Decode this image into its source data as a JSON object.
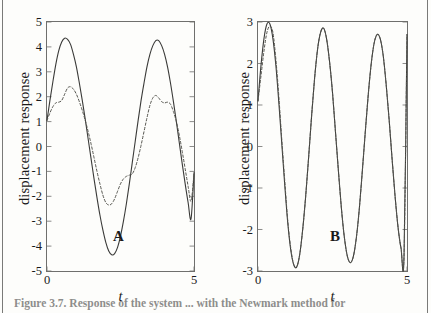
{
  "figure": {
    "caption_fragment": "Figure 3.7.   Response of the system ... with the Newmark method for",
    "panels": [
      "A",
      "B"
    ]
  },
  "panel_a": {
    "tag": "A",
    "xlabel": "t",
    "ylabel": "displacement response",
    "yticks": [
      "5",
      "4",
      "3",
      "2",
      "1",
      "0",
      "-1",
      "-2",
      "-3",
      "-4",
      "-5"
    ],
    "xticks": [
      "0",
      "5"
    ]
  },
  "panel_b": {
    "tag": "B",
    "xlabel": "t",
    "ylabel": "displacement response",
    "yticks": [
      "3",
      "2",
      "1",
      "0",
      "-1",
      "-2",
      "-3"
    ],
    "xticks": [
      "0",
      "5"
    ]
  },
  "colors": {
    "axis": "#6f6f6d",
    "solid_curve": "#3a3a38",
    "dashed_curve": "#55554f",
    "background": "#fdfdfb"
  },
  "chart_data": [
    {
      "type": "line",
      "title": "A",
      "xlabel": "t",
      "ylabel": "displacement response",
      "xlim": [
        0,
        5
      ],
      "ylim": [
        -5,
        5
      ],
      "grid": false,
      "legend": "none",
      "xticks": [
        0,
        5
      ],
      "yticks": [
        -5,
        -4,
        -3,
        -2,
        -1,
        0,
        1,
        2,
        3,
        4,
        5
      ],
      "series": [
        {
          "name": "exact solution",
          "style": "solid",
          "x": [
            0.0,
            0.1,
            0.2,
            0.3,
            0.4,
            0.5,
            0.6,
            0.7,
            0.8,
            0.9,
            1.0,
            1.1,
            1.2,
            1.3,
            1.4,
            1.5,
            1.6,
            1.7,
            1.8,
            1.9,
            2.0,
            2.1,
            2.2,
            2.3,
            2.4,
            2.5,
            2.6,
            2.7,
            2.8,
            2.9,
            3.0,
            3.1,
            3.2,
            3.3,
            3.4,
            3.5,
            3.6,
            3.7,
            3.8,
            3.9,
            4.0,
            4.1,
            4.2,
            4.3,
            4.4,
            4.5,
            4.6,
            4.7,
            4.8,
            4.9,
            5.0
          ],
          "y": [
            1.05,
            1.85,
            2.6,
            3.3,
            3.85,
            4.2,
            4.35,
            4.3,
            4.1,
            3.7,
            3.2,
            2.55,
            1.85,
            1.1,
            0.3,
            -0.5,
            -1.3,
            -2.05,
            -2.75,
            -3.35,
            -3.85,
            -4.2,
            -4.35,
            -4.3,
            -4.05,
            -3.6,
            -3.0,
            -2.3,
            -1.5,
            -0.65,
            0.2,
            1.05,
            1.85,
            2.55,
            3.2,
            3.7,
            4.05,
            4.25,
            4.25,
            4.05,
            3.7,
            3.2,
            2.55,
            1.8,
            1.0,
            0.15,
            -0.7,
            -1.5,
            -2.25,
            -2.9,
            -1.05
          ]
        },
        {
          "name": "numerical solution",
          "style": "dashed",
          "x": [
            0.0,
            0.1,
            0.2,
            0.3,
            0.4,
            0.5,
            0.6,
            0.7,
            0.8,
            0.9,
            1.0,
            1.1,
            1.2,
            1.3,
            1.4,
            1.5,
            1.6,
            1.7,
            1.8,
            1.9,
            2.0,
            2.1,
            2.2,
            2.3,
            2.4,
            2.5,
            2.6,
            2.7,
            2.8,
            2.9,
            3.0,
            3.1,
            3.2,
            3.3,
            3.4,
            3.5,
            3.6,
            3.7,
            3.8,
            3.9,
            4.0,
            4.1,
            4.2,
            4.3,
            4.4,
            4.5,
            4.6,
            4.7,
            4.8,
            4.9,
            5.0
          ],
          "y": [
            1.05,
            1.35,
            1.6,
            1.75,
            1.78,
            1.85,
            2.1,
            2.35,
            2.4,
            2.3,
            2.1,
            1.8,
            1.45,
            1.05,
            0.6,
            0.1,
            -0.45,
            -1.0,
            -1.5,
            -1.95,
            -2.25,
            -2.35,
            -2.3,
            -2.1,
            -1.8,
            -1.5,
            -1.3,
            -1.2,
            -1.15,
            -1.1,
            -0.85,
            -0.45,
            0.05,
            0.6,
            1.15,
            1.65,
            1.95,
            2.05,
            1.95,
            1.8,
            1.75,
            1.78,
            1.7,
            1.4,
            1.0,
            0.45,
            -0.2,
            -0.9,
            -1.6,
            -2.2,
            -1.1
          ]
        }
      ]
    },
    {
      "type": "line",
      "title": "B",
      "xlabel": "t",
      "ylabel": "displacement response",
      "xlim": [
        0,
        5
      ],
      "ylim": [
        -3,
        3
      ],
      "grid": false,
      "legend": "none",
      "xticks": [
        0,
        5
      ],
      "yticks": [
        -3,
        -2,
        -1,
        0,
        1,
        2,
        3
      ],
      "series": [
        {
          "name": "exact solution",
          "style": "solid",
          "x": [
            0.0,
            0.1,
            0.2,
            0.3,
            0.4,
            0.5,
            0.6,
            0.7,
            0.8,
            0.9,
            1.0,
            1.1,
            1.2,
            1.3,
            1.4,
            1.5,
            1.6,
            1.7,
            1.8,
            1.9,
            2.0,
            2.1,
            2.2,
            2.3,
            2.4,
            2.5,
            2.6,
            2.7,
            2.8,
            2.9,
            3.0,
            3.1,
            3.2,
            3.3,
            3.4,
            3.5,
            3.6,
            3.7,
            3.8,
            3.9,
            4.0,
            4.1,
            4.2,
            4.3,
            4.4,
            4.5,
            4.6,
            4.7,
            4.8,
            4.9,
            5.0
          ],
          "y": [
            1.1,
            1.95,
            2.6,
            2.95,
            2.95,
            2.6,
            1.95,
            1.05,
            0.05,
            -0.95,
            -1.85,
            -2.5,
            -2.85,
            -2.9,
            -2.6,
            -2.0,
            -1.2,
            -0.25,
            0.75,
            1.65,
            2.35,
            2.75,
            2.85,
            2.6,
            2.05,
            1.3,
            0.35,
            -0.6,
            -1.5,
            -2.2,
            -2.65,
            -2.8,
            -2.65,
            -2.2,
            -1.5,
            -0.6,
            0.35,
            1.25,
            2.0,
            2.5,
            2.7,
            2.6,
            2.2,
            1.5,
            0.65,
            -0.3,
            -1.2,
            -1.95,
            -2.45,
            -2.65,
            2.7
          ]
        },
        {
          "name": "numerical solution",
          "style": "dashed",
          "x": [
            0.0,
            0.1,
            0.2,
            0.3,
            0.4,
            0.5,
            0.6,
            0.7,
            0.8,
            0.9,
            1.0,
            1.1,
            1.2,
            1.3,
            1.4,
            1.5,
            1.6,
            1.7,
            1.8,
            1.9,
            2.0,
            2.1,
            2.2,
            2.3,
            2.4,
            2.5,
            2.6,
            2.7,
            2.8,
            2.9,
            3.0,
            3.1,
            3.2,
            3.3,
            3.4,
            3.5,
            3.6,
            3.7,
            3.8,
            3.9,
            4.0,
            4.1,
            4.2,
            4.3,
            4.4,
            4.5,
            4.6,
            4.7,
            4.8,
            4.9,
            5.0
          ],
          "y": [
            1.1,
            1.7,
            2.3,
            2.75,
            2.9,
            2.75,
            2.1,
            1.2,
            0.15,
            -0.85,
            -1.8,
            -2.45,
            -2.85,
            -2.9,
            -2.6,
            -2.0,
            -1.2,
            -0.25,
            0.75,
            1.65,
            2.35,
            2.75,
            2.85,
            2.6,
            2.05,
            1.3,
            0.35,
            -0.6,
            -1.5,
            -2.2,
            -2.65,
            -2.8,
            -2.65,
            -2.2,
            -1.5,
            -0.6,
            0.35,
            1.25,
            2.0,
            2.5,
            2.7,
            2.6,
            2.2,
            1.5,
            0.65,
            -0.3,
            -1.2,
            -1.95,
            -2.45,
            -2.65,
            2.7
          ]
        }
      ]
    }
  ]
}
